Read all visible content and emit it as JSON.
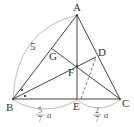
{
  "diagram": {
    "colors": {
      "line": "#444444",
      "arc": "#999999",
      "text": "#333333"
    },
    "points": {
      "A": {
        "label": "A",
        "x": 77,
        "y": 15
      },
      "B": {
        "label": "B",
        "x": 13,
        "y": 99
      },
      "C": {
        "label": "C",
        "x": 120,
        "y": 99
      },
      "D": {
        "label": "D",
        "x": 96,
        "y": 57
      },
      "E": {
        "label": "E",
        "x": 77,
        "y": 99
      },
      "F": {
        "label": "F",
        "x": 77,
        "y": 66
      },
      "G": {
        "label": "G",
        "x": 51,
        "y": 48
      }
    },
    "labels": {
      "A": "A",
      "B": "B",
      "C": "C",
      "D": "D",
      "E": "E",
      "F": "F",
      "G": "G",
      "side_AB": "5",
      "BE_num": "5",
      "BE_den": "7",
      "BE_var": "a",
      "EC_num": "2",
      "EC_den": "7",
      "EC_var": "a"
    }
  }
}
